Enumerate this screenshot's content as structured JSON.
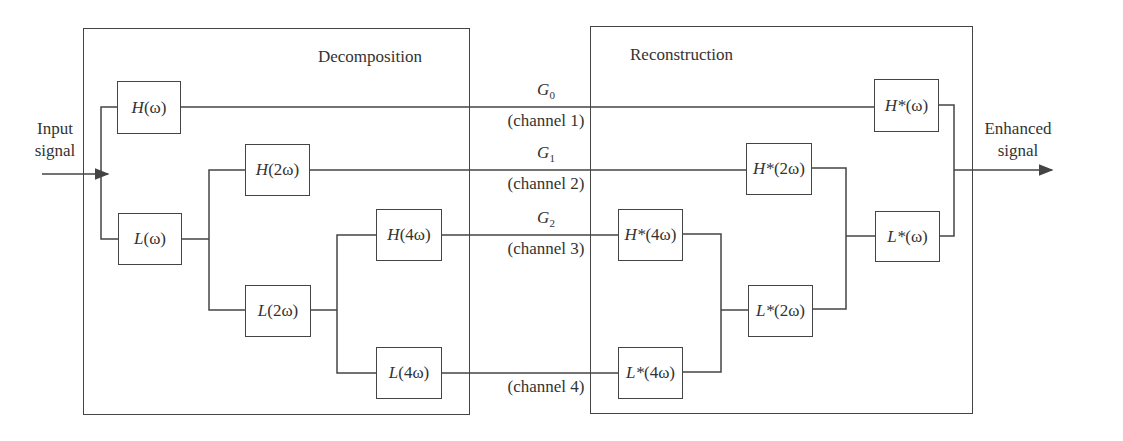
{
  "diagram": {
    "input_label": [
      "Input",
      "signal"
    ],
    "output_label": [
      "Enhanced",
      "signal"
    ],
    "stages": {
      "decomposition": {
        "title": "Decomposition"
      },
      "reconstruction": {
        "title": "Reconstruction"
      }
    },
    "decomposition_filters": [
      {
        "id": "H1",
        "fn": "H",
        "arg": "(ω)"
      },
      {
        "id": "L1",
        "fn": "L",
        "arg": "(ω)"
      },
      {
        "id": "H2",
        "fn": "H",
        "arg": "(2ω)"
      },
      {
        "id": "L2",
        "fn": "L",
        "arg": "(2ω)"
      },
      {
        "id": "H4",
        "fn": "H",
        "arg": "(4ω)"
      },
      {
        "id": "L4",
        "fn": "L",
        "arg": "(4ω)"
      }
    ],
    "reconstruction_filters": [
      {
        "id": "Hs4",
        "fn": "H*",
        "arg": "(4ω)"
      },
      {
        "id": "Ls4",
        "fn": "L*",
        "arg": "(4ω)"
      },
      {
        "id": "Hs2",
        "fn": "H*",
        "arg": "(2ω)"
      },
      {
        "id": "Ls2",
        "fn": "L*",
        "arg": "(2ω)"
      },
      {
        "id": "Hs1",
        "fn": "H*",
        "arg": "(ω)"
      },
      {
        "id": "Ls1",
        "fn": "L*",
        "arg": "(ω)"
      }
    ],
    "channels": [
      {
        "gain": "G",
        "sub": "0",
        "label": "(channel 1)"
      },
      {
        "gain": "G",
        "sub": "1",
        "label": "(channel 2)"
      },
      {
        "gain": "G",
        "sub": "2",
        "label": "(channel 3)"
      },
      {
        "label": "(channel 4)"
      }
    ],
    "colors": {
      "line": "#444444",
      "text": "#333333",
      "background": "#ffffff"
    }
  }
}
